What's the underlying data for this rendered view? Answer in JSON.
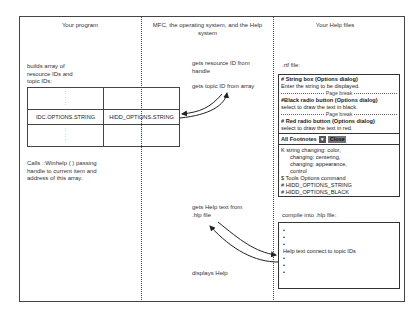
{
  "columns": {
    "program": {
      "title": "Your program",
      "builds_text": "builds array of resource IDs and topic IDs:",
      "table": {
        "row_top": [
          ":",
          ":"
        ],
        "row_mid": [
          "IDC.OPTIONS.STRING",
          "HIDD_OPTIONS.STRING"
        ],
        "row_bottom": [
          ":",
          ":"
        ]
      },
      "calls_text": "Calls ::Winhelp ( ) passing handle to current item and address of this array."
    },
    "mfc": {
      "title": "MFC, the operating system, and the Help system",
      "step1": "gets resource ID from handle",
      "step2": "gets topic ID from array",
      "step3": "gets Help text from .hlp file",
      "step4": "displays Help"
    },
    "help": {
      "title": "Your Help files",
      "rtf_label": ".rtf file:",
      "rtf_entries": [
        {
          "heading": "# String box (Options dialog)",
          "body": "Enter the string to be displayed."
        },
        {
          "heading": "#Black radio button (Options dialog)",
          "body": "select to draw the text in black."
        },
        {
          "heading": "# Red radio button (Options dialog)",
          "body": "select to draw the text in red."
        }
      ],
      "page_break_label": "Page break",
      "footnote_bar": {
        "select_label": "All Footnotes",
        "dropdown_icon": "▼",
        "close_label": "Close"
      },
      "footnotes": {
        "k_line": "K string changing: color,",
        "k_sub1": "changing: centering,",
        "k_sub2": "changing: appearance,",
        "k_sub3": "control",
        "dollar_line": "$ Tools Options command",
        "hash1": "# HIDD_OPTIONS_STRING",
        "hash2": "# HIDD_OPTIONS_BLACK"
      },
      "compile_label": "compile into .hlp file:",
      "hlp_box": {
        "dot": "•",
        "text": "Help text connect to topic IDs"
      }
    }
  }
}
